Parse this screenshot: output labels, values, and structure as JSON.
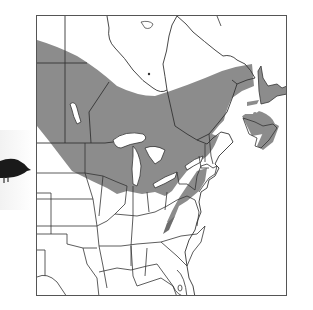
{
  "figure": {
    "type": "range-map",
    "region": "Eastern North America",
    "colors": {
      "range_fill": "#8c8c8c",
      "background": "#ffffff",
      "borders": "#333333",
      "water": "#ffffff",
      "bird": "#1a1a1a"
    }
  },
  "photo": {
    "subject": "bird-silhouette",
    "cropped": true
  },
  "map": {
    "shaded_range_label": "Range",
    "frame": {
      "x": 36,
      "y": 15,
      "width": 251,
      "height": 281
    }
  }
}
